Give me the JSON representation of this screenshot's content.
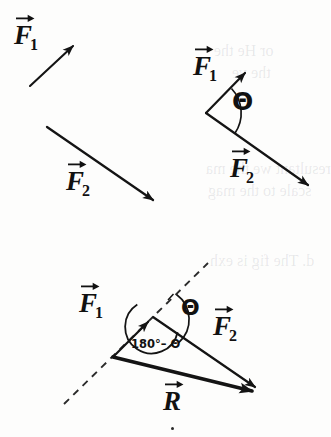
{
  "figure": {
    "background_color": "#fdfdfc",
    "ink_color": "#111111",
    "stray_dot_present": true
  },
  "panels": [
    {
      "id": "panel-separate-vectors",
      "caption": "Two separate force vectors",
      "vectors": [
        {
          "name": "F1",
          "label": "F",
          "subscript": "1",
          "x1": 30,
          "y1": 86,
          "x2": 79,
          "y2": 41,
          "label_x": 14,
          "label_y": 22
        },
        {
          "name": "F2",
          "label": "F",
          "subscript": "2",
          "x1": 47,
          "y1": 127,
          "x2": 161,
          "y2": 206,
          "label_x": 66,
          "label_y": 168
        }
      ]
    },
    {
      "id": "panel-angle-theta",
      "caption": "Vectors drawn tail-to-tail with included angle theta",
      "origin": {
        "x": 206,
        "y": 113
      },
      "angle_symbol": "Θ",
      "angle_label_x": 232,
      "angle_label_y": 89,
      "vectors": [
        {
          "name": "F1",
          "label": "F",
          "subscript": "1",
          "x1": 206,
          "y1": 113,
          "x2": 251,
          "y2": 67,
          "label_x": 193,
          "label_y": 53
        },
        {
          "name": "F2",
          "label": "F",
          "subscript": "2",
          "x1": 206,
          "y1": 113,
          "x2": 316,
          "y2": 191,
          "label_x": 230,
          "label_y": 155
        }
      ]
    },
    {
      "id": "panel-resultant-triangle",
      "caption": "Triangle method: resultant R with interior angle 180 degrees minus theta",
      "tail": {
        "x": 113,
        "y": 357
      },
      "head_f1": {
        "x": 153,
        "y": 317
      },
      "head_r": {
        "x": 265,
        "y": 394
      },
      "angle_symbol": "Θ",
      "angle_label_x": 181,
      "angle_label_y": 297,
      "interior_angle_text": "180°– Θ",
      "interior_angle_x": 131,
      "interior_angle_y": 339,
      "dashed_line": {
        "x1": 64,
        "y1": 404,
        "x2": 208,
        "y2": 263
      },
      "vectors": [
        {
          "name": "F1",
          "label": "F",
          "subscript": "1",
          "x1": 113,
          "y1": 357,
          "x2": 153,
          "y2": 317,
          "label_x": 79,
          "label_y": 290
        },
        {
          "name": "F2",
          "label": "F",
          "subscript": "2",
          "x1": 153,
          "y1": 317,
          "x2": 265,
          "y2": 394,
          "label_x": 213,
          "label_y": 313
        },
        {
          "name": "R",
          "label": "R",
          "subscript": "",
          "x1": 113,
          "y1": 357,
          "x2": 265,
          "y2": 394,
          "label_x": 163,
          "label_y": 388
        }
      ]
    }
  ],
  "bleed_through_text": [
    {
      "text": "or He the",
      "x": 214,
      "y": 42
    },
    {
      "text": "the ve",
      "x": 232,
      "y": 64
    },
    {
      "text": "resultant we the ma",
      "x": 206,
      "y": 160
    },
    {
      "text": "scale to the mag",
      "x": 208,
      "y": 182
    },
    {
      "text": "d. The fig is exh",
      "x": 210,
      "y": 252
    }
  ]
}
